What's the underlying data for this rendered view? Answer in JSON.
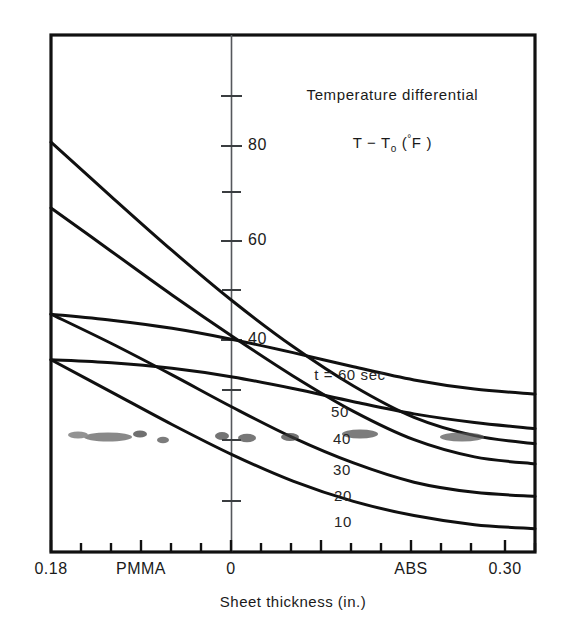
{
  "figure": {
    "background": "#ffffff",
    "ink_color": "#111111"
  },
  "annotation": {
    "title_line1": "Temperature differential",
    "title_line2_pre": "T − T",
    "title_line2_sub": "o",
    "title_line2_post": " (",
    "title_line2_deg": "°",
    "title_line2_unit": "F )"
  },
  "axes": {
    "x_title": "Sheet thickness (in.)",
    "x_tick_labels": [
      "0.18",
      "PMMA",
      "0",
      "ABS",
      "0.30"
    ],
    "y_tick_labels": [
      "80",
      "60",
      "40"
    ]
  },
  "curve_labels": {
    "c60": "t = 60 sec",
    "c50": "50",
    "c40": "40",
    "c30": "30",
    "c20": "20",
    "c10": "10"
  },
  "chart_data": {
    "type": "line",
    "xlabel": "Sheet thickness (in.)",
    "ylabel": "Temperature differential T − To (°F)",
    "xlim": [
      0.18,
      0.3
    ],
    "ylim": [
      0,
      92
    ],
    "x_tick_values": [
      0.18,
      0.21,
      0.24,
      0.27,
      0.3
    ],
    "x_tick_labels": [
      "0.18",
      "PMMA",
      "0",
      "ABS",
      "0.30"
    ],
    "x_minor_ticks": [
      0.195,
      0.225,
      0.255,
      0.285
    ],
    "y_major_ticks": [
      40,
      60,
      80
    ],
    "y_minor_ticks": [
      10,
      20,
      30,
      50,
      70
    ],
    "grid": false,
    "legend": "inline-curve-labels",
    "note": "Annotated reading of six heating-time curves; x axis is shared thickness scale annotated with PMMA and ABS material markers.",
    "series": [
      {
        "name": "t = 60 sec",
        "label": "t = 60 sec",
        "x": [
          0.18,
          0.195,
          0.21,
          0.225,
          0.24,
          0.255,
          0.27,
          0.285,
          0.3
        ],
        "y": [
          47.0,
          45.8,
          44.2,
          42.0,
          39.4,
          36.6,
          34.0,
          32.2,
          31.2
        ]
      },
      {
        "name": "50",
        "label": "50",
        "x": [
          0.18,
          0.195,
          0.21,
          0.225,
          0.24,
          0.255,
          0.27,
          0.285,
          0.3
        ],
        "y": [
          38.0,
          37.4,
          36.3,
          34.6,
          32.3,
          29.7,
          27.3,
          25.6,
          24.4
        ]
      },
      {
        "name": "40",
        "label": "40",
        "x": [
          0.18,
          0.195,
          0.21,
          0.225,
          0.24,
          0.255,
          0.27,
          0.285,
          0.3
        ],
        "y": [
          81.0,
          70.2,
          59.6,
          49.6,
          40.6,
          32.8,
          26.6,
          23.0,
          21.4
        ]
      },
      {
        "name": "30",
        "label": "30",
        "x": [
          0.18,
          0.195,
          0.21,
          0.225,
          0.24,
          0.255,
          0.27,
          0.285,
          0.3
        ],
        "y": [
          68.0,
          59.4,
          50.8,
          42.6,
          34.8,
          27.8,
          22.2,
          18.8,
          17.4
        ]
      },
      {
        "name": "20",
        "label": "20",
        "x": [
          0.18,
          0.195,
          0.21,
          0.225,
          0.24,
          0.255,
          0.27,
          0.285,
          0.3
        ],
        "y": [
          47.0,
          41.2,
          35.0,
          28.6,
          22.6,
          17.6,
          13.8,
          11.8,
          11.0
        ]
      },
      {
        "name": "10",
        "label": "10",
        "x": [
          0.18,
          0.195,
          0.21,
          0.225,
          0.24,
          0.255,
          0.27,
          0.285,
          0.3
        ],
        "y": [
          38.0,
          31.6,
          25.2,
          19.2,
          14.0,
          10.0,
          7.2,
          5.4,
          4.6
        ]
      }
    ]
  }
}
